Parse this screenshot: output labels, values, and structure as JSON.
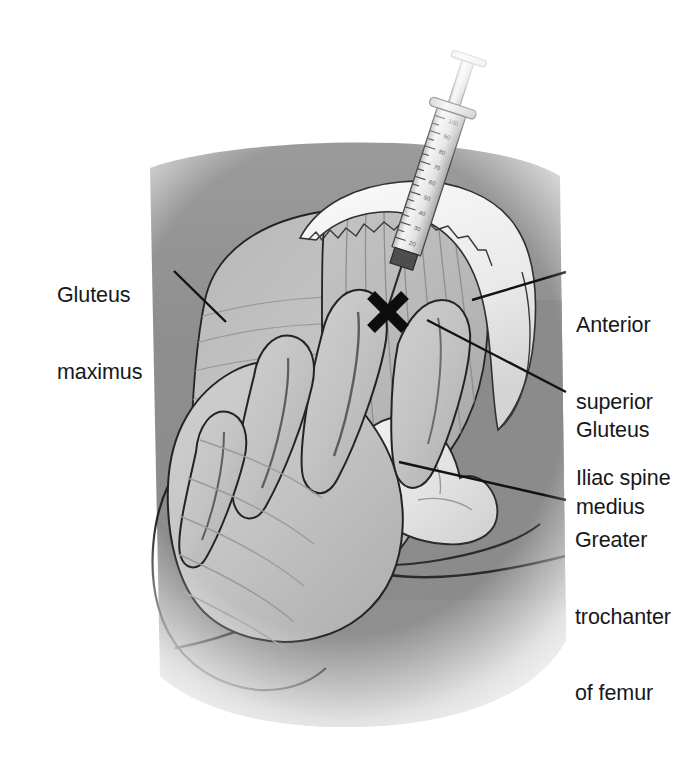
{
  "figure": {
    "kind": "medical-illustration",
    "background_color": "#ffffff",
    "ink_color": "#17181a",
    "marker_glyph": "✖",
    "marker_label": "injection-site-x-mark"
  },
  "labels": {
    "gluteus_maximus": {
      "name": "gluteus-maximus",
      "lines": [
        "Gluteus",
        "maximus"
      ],
      "line1": "Gluteus",
      "line2": "maximus",
      "side": "left"
    },
    "anterior_superior_iliac_spine": {
      "name": "anterior-superior-iliac-spine",
      "lines": [
        "Anterior",
        "superior",
        "Iliac spine"
      ],
      "line1": "Anterior",
      "line2": "superior",
      "line3": "Iliac spine",
      "side": "right"
    },
    "gluteus_medius": {
      "name": "gluteus-medius",
      "lines": [
        "Gluteus",
        "medius"
      ],
      "line1": "Gluteus",
      "line2": "medius",
      "side": "right"
    },
    "greater_trochanter_of_femur": {
      "name": "greater-trochanter-of-femur",
      "lines": [
        "Greater",
        "trochanter",
        "of femur"
      ],
      "line1": "Greater",
      "line2": "trochanter",
      "line3": "of femur",
      "side": "right"
    }
  },
  "syringe": {
    "name": "syringe",
    "barrel_color": "#e8e8e8",
    "hub_color": "#4a4a4a",
    "needle_color": "#2a2a2a",
    "scale_ticks": 26,
    "scale_numbers": [
      "100",
      "90",
      "80",
      "70",
      "60",
      "50",
      "40",
      "30",
      "20",
      "10"
    ]
  },
  "palette": {
    "skin_shadow": "#8d8d8d",
    "skin_mid": "#9a9a9a",
    "muscle_light": "#c9c9c9",
    "muscle_mid": "#b4b4b4",
    "muscle_dark": "#9d9d9d",
    "hand_light": "#c4c4c4",
    "bone_light": "#ededed",
    "bone_mid": "#dcdcdc",
    "crest_highlight": "#f2f2f2",
    "outline": "#1d1d1d"
  }
}
